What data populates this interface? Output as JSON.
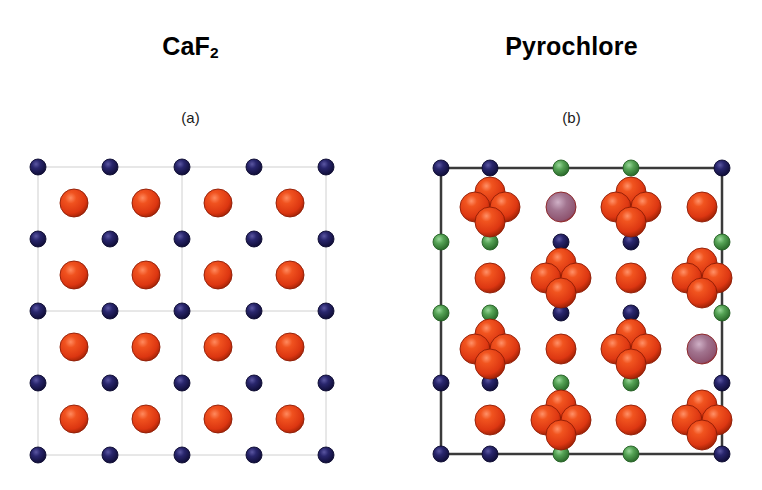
{
  "figure": {
    "background": "#ffffff",
    "width": 762,
    "height": 490
  },
  "panels": [
    {
      "id": "caf2",
      "title_main": "CaF",
      "title_sub": "2",
      "title_plain": "CaF2",
      "caption": "(a)",
      "structure": "fluorite"
    },
    {
      "id": "pyrochlore",
      "title_main": "Pyrochlore",
      "title_sub": "",
      "title_plain": "Pyrochlore",
      "caption": "(b)",
      "structure": "pyrochlore"
    }
  ],
  "colors": {
    "red_atom": "#e03b16",
    "red_atom_edge": "#8d1c05",
    "red_atom_highlight": "#ff9a74",
    "navy_atom": "#1c1a5e",
    "navy_atom_edge": "#0c0a30",
    "navy_atom_highlight": "#6a67ae",
    "green_atom": "#4e9a4e",
    "green_atom_edge": "#246024",
    "green_atom_highlight": "#9ed79e",
    "mauve_atom": "#9b6e8e",
    "mauve_atom_edge": "#8b1f1f",
    "mauve_atom_highlight": "#d3b4c9",
    "cell_line_light": "#d0d0d0",
    "cell_line_dark": "#3a3a3a",
    "title_text": "#000000",
    "caption_text": "#1a1a1a"
  },
  "chart_data": {
    "type": "scatter",
    "xlabel": "",
    "ylabel": "",
    "panels": [
      {
        "name": "CaF2",
        "label": "(a)",
        "cell_box": {
          "x0": 28,
          "y0": 17,
          "x1": 316,
          "y1": 305,
          "stroke": "#d0d0d0",
          "stroke_width": 1
        },
        "inner_lines": [
          {
            "x0": 28,
            "y0": 161,
            "x1": 316,
            "y1": 161
          },
          {
            "x0": 172,
            "y0": 17,
            "x1": 172,
            "y1": 305
          }
        ],
        "site_grids": [
          {
            "element": "Ca",
            "color": "#1c1a5e",
            "radius": 8,
            "rows": 5,
            "cols": 5,
            "x_start": 28,
            "y_start": 17,
            "dx": 72,
            "dy": 72
          },
          {
            "element": "F",
            "color": "#e03b16",
            "radius": 14,
            "rows": 4,
            "cols": 4,
            "x_start": 64,
            "y_start": 53,
            "dx": 72,
            "dy": 72
          }
        ]
      },
      {
        "name": "Pyrochlore",
        "label": "(b)",
        "cell_box": {
          "x0": 26,
          "y0": 18,
          "x1": 307,
          "y1": 304,
          "stroke": "#3a3a3a",
          "stroke_width": 2.5
        },
        "site_groups": [
          {
            "element": "O-tetrahedron",
            "color": "#e03b16",
            "type": "cluster4",
            "radius": 15,
            "offset": 15,
            "centers": [
              [
                75,
                57
              ],
              [
                216,
                57
              ],
              [
                146,
                128
              ],
              [
                287,
                128
              ],
              [
                75,
                199
              ],
              [
                216,
                199
              ],
              [
                146,
                270
              ],
              [
                287,
                270
              ]
            ]
          },
          {
            "element": "O-single",
            "color": "#e03b16",
            "type": "single",
            "radius": 15,
            "centers": [
              [
                287,
                57
              ],
              [
                75,
                128
              ],
              [
                216,
                128
              ],
              [
                146,
                199
              ],
              [
                75,
                270
              ],
              [
                216,
                270
              ]
            ]
          },
          {
            "element": "O-vacancy-site",
            "color": "#9b6e8e",
            "type": "single",
            "radius": 15,
            "centers": [
              [
                146,
                57
              ],
              [
                287,
                199
              ]
            ]
          },
          {
            "element": "A-cation-green",
            "color": "#4e9a4e",
            "type": "single",
            "radius": 8,
            "centers": [
              [
                146,
                18
              ],
              [
                216,
                18
              ],
              [
                26,
                92
              ],
              [
                75,
                92
              ],
              [
                307,
                92
              ],
              [
                26,
                163
              ],
              [
                75,
                163
              ],
              [
                307,
                163
              ],
              [
                146,
                233
              ],
              [
                216,
                233
              ],
              [
                146,
                304
              ],
              [
                216,
                304
              ]
            ]
          },
          {
            "element": "B-cation-navy",
            "color": "#1c1a5e",
            "type": "single",
            "radius": 8,
            "centers": [
              [
                26,
                18
              ],
              [
                75,
                18
              ],
              [
                307,
                18
              ],
              [
                146,
                92
              ],
              [
                216,
                92
              ],
              [
                146,
                163
              ],
              [
                216,
                163
              ],
              [
                26,
                233
              ],
              [
                75,
                233
              ],
              [
                307,
                233
              ],
              [
                26,
                304
              ],
              [
                75,
                304
              ],
              [
                307,
                304
              ]
            ]
          }
        ]
      }
    ]
  }
}
